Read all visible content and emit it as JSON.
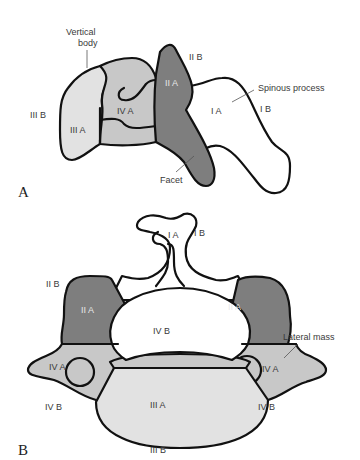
{
  "figure": {
    "panel_a": {
      "letter": "A",
      "labels": {
        "vertical_body": [
          "Vertical",
          "body"
        ],
        "spinous_process": "Spinous process",
        "facet": "Facet",
        "zone_IIIB": "III B",
        "zone_IIIA": "III A",
        "zone_IVA": "IV A",
        "zone_IIA": "II A",
        "zone_IIB": "II B",
        "zone_IA": "I A",
        "zone_IB": "I B"
      }
    },
    "panel_b": {
      "letter": "B",
      "labels": {
        "zone_IA": "I A",
        "zone_IB": "I B",
        "zone_IIB": "II B",
        "zone_IIA_left": "II A",
        "zone_IIA_right": "II A",
        "zone_IVB_center": "IV B",
        "lateral_mass": "Lateral mass",
        "zone_IVA_left": "IV A",
        "zone_IVA_right": "IV A",
        "zone_IVB_left": "IV B",
        "zone_IVB_right": "IV B",
        "zone_IIIA": "III A",
        "zone_IIIB": "III B"
      }
    },
    "colors": {
      "zone_I": "#ffffff",
      "zone_II": "#7e7e7e",
      "zone_III": "#e2e2e2",
      "zone_IV": "#c8c8c8",
      "outline": "#111111"
    }
  }
}
